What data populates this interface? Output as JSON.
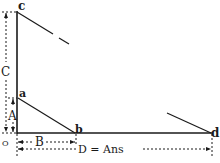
{
  "diagram": {
    "points": {
      "c": "c",
      "a": "a",
      "b": "b",
      "d": "d",
      "origin": "O"
    },
    "dimensions": {
      "A": "A",
      "B": "B",
      "C": "C",
      "D": "D = Ans"
    },
    "colors": {
      "ink": "#1a1a1a",
      "background": "#ffffff"
    }
  }
}
